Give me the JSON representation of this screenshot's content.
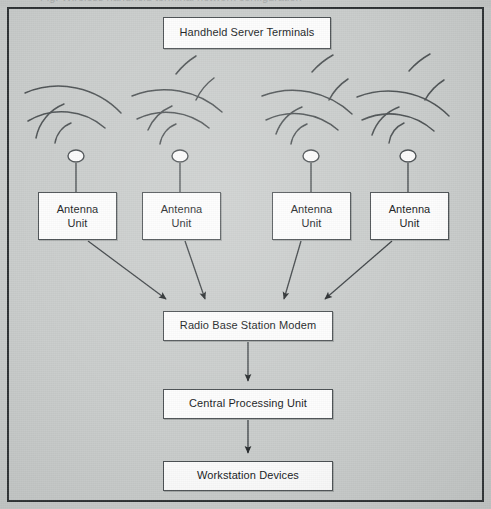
{
  "diagram": {
    "title_sliver": "Fig. Wireless handheld terminal network configuration",
    "background_color": "#c9cccb",
    "node_fill": "#fdfdfd",
    "node_stroke": "#4a4f52",
    "line_color": "#3a3f42",
    "frame_color": "#2b2f31"
  },
  "nodes": {
    "handheld": {
      "label": "Handheld Server Terminals",
      "x": 163,
      "y": 17,
      "w": 168,
      "h": 32
    },
    "antenna_1": {
      "label_line1": "Antenna",
      "label_line2": "Unit",
      "x": 38,
      "y": 192,
      "w": 79,
      "h": 48
    },
    "antenna_2": {
      "label_line1": "Antenna",
      "label_line2": "Unit",
      "x": 142,
      "y": 192,
      "w": 79,
      "h": 48
    },
    "antenna_3": {
      "label_line1": "Antenna",
      "label_line2": "Unit",
      "x": 272,
      "y": 192,
      "w": 79,
      "h": 48
    },
    "antenna_4": {
      "label_line1": "Antenna",
      "label_line2": "Unit",
      "x": 370,
      "y": 192,
      "w": 79,
      "h": 48
    },
    "modem": {
      "label": "Radio Base Station Modem",
      "x": 163,
      "y": 311,
      "w": 170,
      "h": 30
    },
    "cpu": {
      "label": "Central Processing Unit",
      "x": 163,
      "y": 389,
      "w": 170,
      "h": 30
    },
    "workstation": {
      "label": "Workstation Devices",
      "x": 163,
      "y": 461,
      "w": 170,
      "h": 30
    }
  },
  "antennas": [
    {
      "name": "antenna-mast-1",
      "cx": 76,
      "cy": 156,
      "stem_bottom": 192
    },
    {
      "name": "antenna-mast-2",
      "cx": 180,
      "cy": 156,
      "stem_bottom": 192
    },
    {
      "name": "antenna-mast-3",
      "cx": 311,
      "cy": 156,
      "stem_bottom": 192
    },
    {
      "name": "antenna-mast-4",
      "cx": 408,
      "cy": 156,
      "stem_bottom": 192
    }
  ],
  "edges": [
    {
      "name": "antenna-1-to-modem",
      "from": "antenna_1",
      "to": "modem",
      "type": "arrow-diagonal"
    },
    {
      "name": "antenna-2-to-modem",
      "from": "antenna_2",
      "to": "modem",
      "type": "arrow-diagonal"
    },
    {
      "name": "antenna-3-to-modem",
      "from": "antenna_3",
      "to": "modem",
      "type": "arrow-diagonal"
    },
    {
      "name": "antenna-4-to-modem",
      "from": "antenna_4",
      "to": "modem",
      "type": "arrow-diagonal"
    },
    {
      "name": "modem-to-cpu",
      "from": "modem",
      "to": "cpu",
      "type": "arrow-vertical"
    },
    {
      "name": "cpu-to-workstation",
      "from": "cpu",
      "to": "workstation",
      "type": "arrow-vertical"
    }
  ],
  "radio_waves": {
    "description": "concentric arcs radiating upward from each antenna mast",
    "arcs_per_side": 4,
    "sides": [
      "left",
      "right"
    ],
    "radii": [
      26,
      46,
      66,
      86
    ]
  }
}
